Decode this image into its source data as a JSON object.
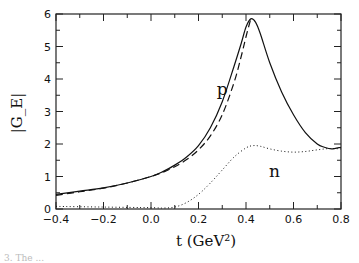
{
  "chart_data": {
    "type": "line",
    "title": "",
    "xlabel": "t  (GeV²)",
    "ylabel": "|G_E|",
    "xlim": [
      -0.4,
      0.8
    ],
    "ylim": [
      0,
      6
    ],
    "x_ticks": [
      -0.4,
      -0.2,
      0.0,
      0.2,
      0.4,
      0.6,
      0.8
    ],
    "x_tick_labels": [
      "-0.4",
      "-0.2",
      "0.0",
      "0.2",
      "0.4",
      "0.6",
      "0.8"
    ],
    "y_ticks": [
      0,
      1,
      2,
      3,
      4,
      5,
      6
    ],
    "y_tick_labels": [
      "0",
      "1",
      "2",
      "3",
      "4",
      "5",
      "6"
    ],
    "grid": false,
    "legend": null,
    "annotations": [
      {
        "text": "p",
        "x": 0.3,
        "y": 3.5
      },
      {
        "text": "n",
        "x": 0.52,
        "y": 1.0
      }
    ],
    "series": [
      {
        "name": "proton (solid)",
        "style": "solid",
        "x": [
          -0.4,
          -0.3,
          -0.2,
          -0.1,
          0.0,
          0.05,
          0.1,
          0.15,
          0.2,
          0.25,
          0.3,
          0.35,
          0.38,
          0.4,
          0.42,
          0.44,
          0.46,
          0.5,
          0.55,
          0.6,
          0.65,
          0.7,
          0.73,
          0.76,
          0.8
        ],
        "y": [
          0.45,
          0.55,
          0.65,
          0.8,
          1.0,
          1.15,
          1.35,
          1.6,
          1.95,
          2.5,
          3.3,
          4.4,
          5.1,
          5.6,
          5.85,
          5.75,
          5.4,
          4.5,
          3.6,
          2.9,
          2.35,
          2.0,
          1.9,
          1.85,
          1.9
        ]
      },
      {
        "name": "proton (dashed)",
        "style": "dashed",
        "x": [
          -0.4,
          -0.3,
          -0.2,
          -0.1,
          0.0,
          0.05,
          0.1,
          0.15,
          0.2,
          0.25,
          0.3,
          0.35,
          0.38,
          0.4,
          0.42
        ],
        "y": [
          0.42,
          0.53,
          0.64,
          0.8,
          1.0,
          1.13,
          1.3,
          1.52,
          1.82,
          2.25,
          2.9,
          3.9,
          4.7,
          5.3,
          5.85
        ]
      },
      {
        "name": "neutron (dotted)",
        "style": "dotted",
        "x": [
          -0.4,
          -0.2,
          0.0,
          0.05,
          0.1,
          0.15,
          0.2,
          0.25,
          0.3,
          0.35,
          0.4,
          0.43,
          0.46,
          0.5,
          0.55,
          0.6,
          0.65,
          0.7,
          0.75,
          0.8
        ],
        "y": [
          0.08,
          0.06,
          0.04,
          0.03,
          0.06,
          0.2,
          0.45,
          0.8,
          1.2,
          1.6,
          1.88,
          1.95,
          1.93,
          1.85,
          1.78,
          1.75,
          1.77,
          1.82,
          1.86,
          1.85
        ]
      }
    ]
  },
  "caption": {
    "text": "3. The ... "
  }
}
